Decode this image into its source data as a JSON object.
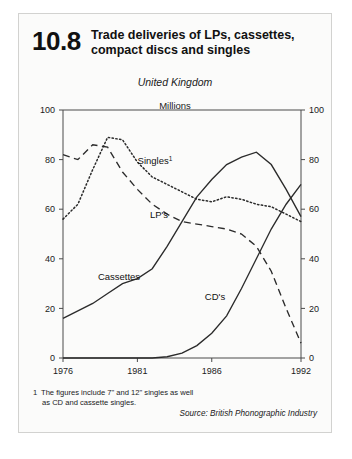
{
  "figure": {
    "number": "10.8",
    "title": "Trade deliveries of LPs, cassettes, compact discs and singles",
    "region": "United Kingdom",
    "units": "Millions",
    "footnote_marker": "1",
    "footnote_line1": "The figures include 7\" and 12\" singles as well",
    "footnote_line2": "as CD and cassette singles.",
    "source": "Source: British Phonographic Industry"
  },
  "chart_data": {
    "type": "line",
    "title": "Trade deliveries of LPs, cassettes, compact discs and singles",
    "subtitle": "United Kingdom",
    "ylabel": "Millions",
    "xlabel": "",
    "xlim": [
      1976,
      1992
    ],
    "ylim": [
      0,
      100
    ],
    "yticks": [
      0,
      20,
      40,
      60,
      80,
      100
    ],
    "xticks": [
      1976,
      1981,
      1986,
      1992
    ],
    "xtick_labels": [
      "1976",
      "1981",
      "1986",
      "1992"
    ],
    "ytick_labels_left": [
      "0",
      "20",
      "40",
      "60",
      "80",
      "100"
    ],
    "ytick_labels_right": [
      "0",
      "20",
      "40",
      "60",
      "80",
      "100"
    ],
    "grid": false,
    "legend": "inline-labels",
    "x": [
      1976,
      1977,
      1978,
      1979,
      1980,
      1981,
      1982,
      1983,
      1984,
      1985,
      1986,
      1987,
      1988,
      1989,
      1990,
      1991,
      1992
    ],
    "series": [
      {
        "name": "Singles",
        "label": "Singles",
        "label_superscript": "1",
        "style": "dotted",
        "values": [
          56,
          62,
          76,
          89,
          88,
          79,
          73,
          70,
          67,
          64,
          63,
          65,
          64,
          62,
          61,
          58,
          55
        ]
      },
      {
        "name": "LP's",
        "label": "LP's",
        "style": "dashed",
        "values": [
          82,
          80,
          86,
          85,
          75,
          68,
          62,
          58,
          55,
          54,
          53,
          52,
          50,
          45,
          35,
          20,
          6
        ]
      },
      {
        "name": "Cassettes",
        "label": "Cassettes",
        "style": "solid",
        "values": [
          16,
          19,
          22,
          26,
          30,
          32,
          36,
          45,
          55,
          65,
          72,
          78,
          81,
          83,
          78,
          68,
          57
        ]
      },
      {
        "name": "CD's",
        "label": "CD's",
        "style": "solid",
        "values": [
          0,
          0,
          0,
          0,
          0,
          0,
          0,
          0.5,
          2,
          5,
          10,
          17,
          28,
          40,
          52,
          62,
          70
        ]
      }
    ]
  }
}
